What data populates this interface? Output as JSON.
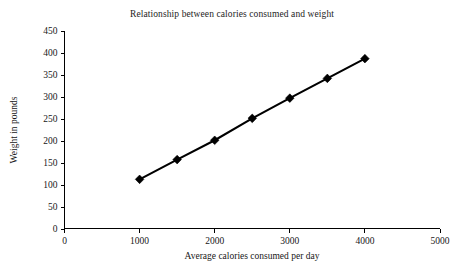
{
  "chart_data": {
    "type": "line",
    "title": "Relationship between calories consumed and weight",
    "xlabel": "Average calories consumed per day",
    "ylabel": "Weight in pounds",
    "x": [
      1000,
      1500,
      2000,
      2500,
      3000,
      3500,
      4000
    ],
    "values": [
      112,
      157,
      201,
      251,
      297,
      342,
      387
    ],
    "series": [
      {
        "name": "Weight in pounds",
        "values": [
          112,
          157,
          201,
          251,
          297,
          342,
          387
        ]
      }
    ],
    "xlim": [
      0,
      5000
    ],
    "ylim": [
      0,
      450
    ],
    "xticks": [
      0,
      1000,
      2000,
      3000,
      4000,
      5000
    ],
    "yticks": [
      0,
      50,
      100,
      150,
      200,
      250,
      300,
      350,
      400,
      450
    ],
    "xtick_labels": [
      "0",
      "1000",
      "2000",
      "3000",
      "4000",
      "5000"
    ],
    "ytick_labels": [
      "0",
      "50",
      "100",
      "150",
      "200",
      "250",
      "300",
      "350",
      "400",
      "450"
    ],
    "grid": false,
    "legend": false,
    "legend_position": "none",
    "marker": "diamond",
    "line_color": "#000000",
    "marker_color": "#000000",
    "background_color": "#ffffff"
  }
}
